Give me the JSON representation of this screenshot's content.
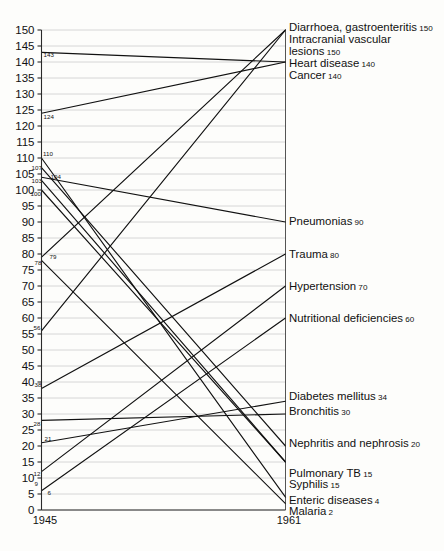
{
  "chart_data": {
    "type": "line",
    "subtype": "slope-chart",
    "title": "",
    "xlabel": "",
    "ylabel": "",
    "x": [
      "1945",
      "1961"
    ],
    "categories": [
      "1945",
      "1961"
    ],
    "ylim": [
      0,
      150
    ],
    "ytick_step": 5,
    "yticks": [
      0,
      5,
      10,
      15,
      20,
      25,
      30,
      35,
      40,
      45,
      50,
      55,
      60,
      65,
      70,
      75,
      80,
      85,
      90,
      95,
      100,
      105,
      110,
      115,
      120,
      125,
      130,
      135,
      140,
      145,
      150
    ],
    "grid": true,
    "legend": "none",
    "series": [
      {
        "name": "Diarrhoea, gastroenteritis",
        "start": 56,
        "end": 150,
        "start_label": "56",
        "end_label": "150"
      },
      {
        "name": "Intracranial vascular lesions",
        "start": 79,
        "end": 150,
        "start_label": "79",
        "end_label": "150"
      },
      {
        "name": "Heart disease",
        "start": 143,
        "end": 140,
        "start_label": "143",
        "end_label": "140"
      },
      {
        "name": "Cancer",
        "start": 124,
        "end": 140,
        "start_label": "124",
        "end_label": "140"
      },
      {
        "name": "Pneumonias",
        "start": 104,
        "end": 90,
        "start_label": "104",
        "end_label": "90"
      },
      {
        "name": "Trauma",
        "start": 38,
        "end": 80,
        "start_label": "38",
        "end_label": "80"
      },
      {
        "name": "Hypertension",
        "start": 12,
        "end": 70,
        "start_label": "12",
        "end_label": "70"
      },
      {
        "name": "Nutritional deficiencies",
        "start": 6,
        "end": 60,
        "start_label": "6",
        "end_label": "60"
      },
      {
        "name": "Diabetes mellitus",
        "start": 21,
        "end": 34,
        "start_label": "21",
        "end_label": "34"
      },
      {
        "name": "Bronchitis",
        "start": 28,
        "end": 30,
        "start_label": "28",
        "end_label": "30"
      },
      {
        "name": "Nephritis and nephrosis",
        "start": 107,
        "end": 20,
        "start_label": "107",
        "end_label": "20"
      },
      {
        "name": "Pulmonary TB",
        "start": 103,
        "end": 15,
        "start_label": "103",
        "end_label": "15"
      },
      {
        "name": "Syphilis",
        "start": 100,
        "end": 15,
        "start_label": "100",
        "end_label": "15"
      },
      {
        "name": "Enteric diseases",
        "start": 110,
        "end": 4,
        "start_label": "110",
        "end_label": "4"
      },
      {
        "name": "Malaria",
        "start": 78,
        "end": 2,
        "start_label": "78",
        "end_label": "2"
      }
    ],
    "left_value_labels": [
      "143",
      "124",
      "110",
      "107",
      "103",
      "104",
      "100",
      "79",
      "78",
      "56",
      "38",
      "28",
      "21",
      "12",
      "9",
      "6"
    ],
    "right_labels": [
      {
        "name": "Diarrhoea, gastroenteritis",
        "value": "150"
      },
      {
        "name": "Intracranial vascular",
        "value": ""
      },
      {
        "name": "lesions",
        "value": "150"
      },
      {
        "name": "Heart disease",
        "value": "140"
      },
      {
        "name": "Cancer",
        "value": "140"
      },
      {
        "name": "Pneumonias",
        "value": "90"
      },
      {
        "name": "Trauma",
        "value": "80"
      },
      {
        "name": "Hypertension",
        "value": "70"
      },
      {
        "name": "Nutritional deficiencies",
        "value": "60"
      },
      {
        "name": "Diabetes mellitus",
        "value": "34"
      },
      {
        "name": "Bronchitis",
        "value": "30"
      },
      {
        "name": "Nephritis and nephrosis",
        "value": "20"
      },
      {
        "name": "Pulmonary TB",
        "value": "15"
      },
      {
        "name": "Syphilis",
        "value": "15"
      },
      {
        "name": "Enteric diseases",
        "value": "4"
      },
      {
        "name": "Malaria",
        "value": "2"
      }
    ]
  },
  "axis": {
    "x_left_label": "1945",
    "x_right_label": "1961"
  },
  "colors": {
    "line": "#111111",
    "grid": "#b9b9b9",
    "axis": "#2a2a2a",
    "background": "#fdfdfb"
  }
}
